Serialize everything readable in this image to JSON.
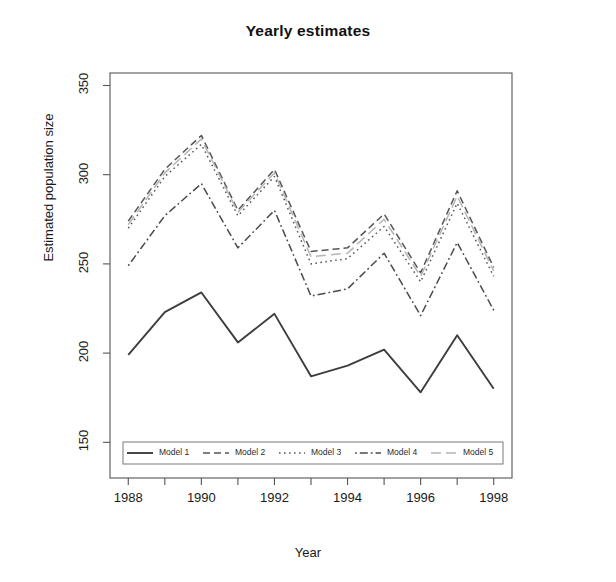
{
  "chart_data": {
    "type": "line",
    "title": "Yearly estimates",
    "xlabel": "Year",
    "ylabel": "Estimated population size",
    "grid": false,
    "legend_position": "bottom-inside",
    "x": [
      1988,
      1989,
      1990,
      1991,
      1992,
      1993,
      1994,
      1995,
      1996,
      1997,
      1998
    ],
    "xlim": [
      1987.5,
      1998.5
    ],
    "ylim": [
      130,
      357
    ],
    "xticks": [
      1988,
      1990,
      1992,
      1994,
      1996,
      1998
    ],
    "xtick_labels": [
      "1988",
      "1990",
      "1992",
      "1994",
      "1996",
      "1998"
    ],
    "yticks": [
      150,
      200,
      250,
      300,
      350
    ],
    "ytick_labels": [
      "150",
      "200",
      "250",
      "300",
      "350"
    ],
    "series": [
      {
        "name": "Model 1",
        "linestyle": "solid",
        "color": "#3d3d3d",
        "values": [
          199,
          223,
          234,
          206,
          222,
          187,
          193,
          202,
          178,
          210,
          180
        ]
      },
      {
        "name": "Model 2",
        "linestyle": "dashed",
        "color": "#555555",
        "values": [
          274,
          303,
          322,
          280,
          303,
          257,
          259,
          278,
          245,
          291,
          248
        ]
      },
      {
        "name": "Model 3",
        "linestyle": "dotted",
        "color": "#5a5a5a",
        "values": [
          270,
          299,
          317,
          277,
          299,
          250,
          253,
          271,
          240,
          284,
          243
        ]
      },
      {
        "name": "Model 4",
        "linestyle": "dashdot",
        "color": "#4a4a4a",
        "values": [
          249,
          277,
          295,
          259,
          280,
          232,
          236,
          256,
          221,
          262,
          224
        ]
      },
      {
        "name": "Model 5",
        "linestyle": "longdash",
        "color": "#b5b5b5",
        "values": [
          272,
          301,
          320,
          279,
          301,
          254,
          256,
          275,
          243,
          288,
          246
        ]
      }
    ]
  },
  "legend": {
    "items": [
      {
        "label": "Model 1",
        "linestyle": "solid"
      },
      {
        "label": "Model 2",
        "linestyle": "dashed"
      },
      {
        "label": "Model 3",
        "linestyle": "dotted"
      },
      {
        "label": "Model 4",
        "linestyle": "dashdot"
      },
      {
        "label": "Model 5",
        "linestyle": "longdash"
      }
    ]
  },
  "axis_frame": {
    "left": 110,
    "right": 512,
    "top": 73,
    "bottom": 478
  }
}
